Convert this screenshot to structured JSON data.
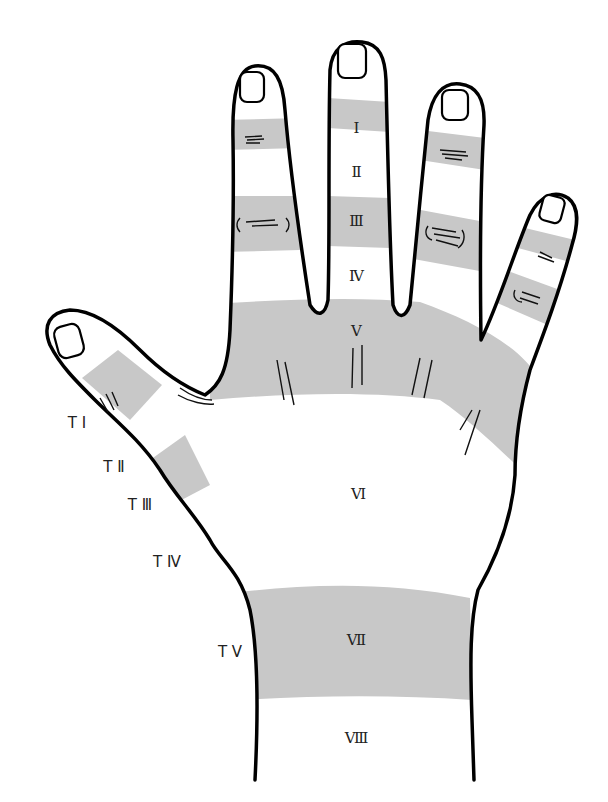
{
  "diagram": {
    "colors": {
      "zone_fill": "#c8c8c8",
      "outline": "#000000",
      "background": "#ffffff",
      "text": "#222222"
    },
    "finger_zones": [
      {
        "id": "I",
        "label": "Ⅰ",
        "shaded": true
      },
      {
        "id": "II",
        "label": "Ⅱ",
        "shaded": false
      },
      {
        "id": "III",
        "label": "Ⅲ",
        "shaded": true
      },
      {
        "id": "IV",
        "label": "Ⅳ",
        "shaded": false
      },
      {
        "id": "V",
        "label": "Ⅴ",
        "shaded": true
      },
      {
        "id": "VI",
        "label": "Ⅵ",
        "shaded": false
      },
      {
        "id": "VII",
        "label": "Ⅶ",
        "shaded": true
      },
      {
        "id": "VIII",
        "label": "Ⅷ",
        "shaded": false
      }
    ],
    "thumb_zones": [
      {
        "id": "TI",
        "label": "T Ⅰ"
      },
      {
        "id": "TII",
        "label": "T Ⅱ"
      },
      {
        "id": "TIII",
        "label": "T Ⅲ"
      },
      {
        "id": "TIV",
        "label": "T Ⅳ"
      },
      {
        "id": "TV",
        "label": "T Ⅴ"
      }
    ]
  }
}
